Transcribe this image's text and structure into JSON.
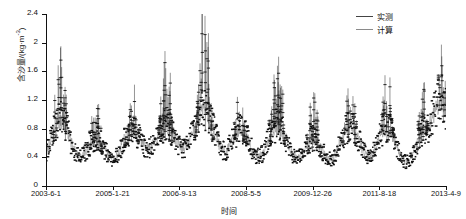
{
  "chart_data": {
    "type": "line",
    "title": "",
    "xlabel": "时间",
    "ylabel": "含沙量/(kg·m",
    "ylabel_sup": "-3",
    "ylabel_tail": ")",
    "ylim": [
      0,
      2.4
    ],
    "yticks": [
      "0",
      "0.4",
      "0.8",
      "1.2",
      "1.6",
      "2",
      "2.4"
    ],
    "ytick_values": [
      0,
      0.4,
      0.8,
      1.2,
      1.6,
      2,
      2.4
    ],
    "xticks": [
      "2003-6-1",
      "2005-1-21",
      "2006-9-13",
      "2008-5-5",
      "2009-12-26",
      "2011-8-18",
      "2013-4-9"
    ],
    "xtick_positions": [
      0.0,
      0.1667,
      0.3333,
      0.5,
      0.6667,
      0.8333,
      1.0
    ],
    "grid": false,
    "legend_position": "top-right",
    "series": [
      {
        "name": "实测",
        "style": "marker-line",
        "color": "#111111",
        "peaks": [
          {
            "center": 0.035,
            "peak": 1.72,
            "body": 0.9,
            "width": 0.028
          },
          {
            "center": 0.125,
            "peak": 1.1,
            "body": 0.62,
            "width": 0.026
          },
          {
            "center": 0.215,
            "peak": 1.32,
            "body": 0.74,
            "width": 0.028
          },
          {
            "center": 0.3,
            "peak": 1.75,
            "body": 0.8,
            "width": 0.028
          },
          {
            "center": 0.395,
            "peak": 2.32,
            "body": 1.02,
            "width": 0.03
          },
          {
            "center": 0.487,
            "peak": 1.33,
            "body": 0.74,
            "width": 0.026
          },
          {
            "center": 0.578,
            "peak": 1.7,
            "body": 0.8,
            "width": 0.028
          },
          {
            "center": 0.668,
            "peak": 1.14,
            "body": 0.62,
            "width": 0.026
          },
          {
            "center": 0.76,
            "peak": 1.52,
            "body": 0.8,
            "width": 0.028
          },
          {
            "center": 0.852,
            "peak": 1.46,
            "body": 0.78,
            "width": 0.026
          },
          {
            "center": 0.944,
            "peak": 1.22,
            "body": 0.66,
            "width": 0.026
          },
          {
            "center": 0.992,
            "peak": 2.12,
            "body": 1.05,
            "width": 0.02
          }
        ],
        "baseline": 0.04
      },
      {
        "name": "计算",
        "style": "line",
        "color": "#8a8a8a"
      }
    ]
  },
  "legend": {
    "items": [
      {
        "label": "实测",
        "color": "#444444"
      },
      {
        "label": "计算",
        "color": "#8a8a8a"
      }
    ]
  },
  "axes": {
    "y_title": "含沙量/(kg·m",
    "y_title_sup": "-3",
    "y_title_tail": ")",
    "x_title": "时间"
  }
}
